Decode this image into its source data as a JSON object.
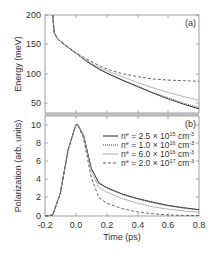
{
  "chart_data": [
    {
      "type": "line",
      "panel_label": "(a)",
      "title": "",
      "xlabel": "",
      "ylabel": "Energy (meV)",
      "xlim": [
        -0.2,
        0.8
      ],
      "ylim": [
        33,
        200
      ],
      "yticks": [
        50,
        100,
        150,
        200
      ],
      "grid": false,
      "x": [
        -0.15,
        -0.14,
        -0.12,
        -0.1,
        -0.05,
        0.0,
        0.05,
        0.1,
        0.15,
        0.2,
        0.3,
        0.4,
        0.5,
        0.6,
        0.7,
        0.8
      ],
      "series": [
        {
          "name": "n^e = 2.5 × 10^15 cm^-3",
          "style": "solid",
          "color": "#222222",
          "values": [
            200,
            170,
            160,
            155,
            145,
            135,
            125,
            116,
            108,
            101,
            89,
            78,
            67,
            57,
            48,
            40
          ]
        },
        {
          "name": "n^e = 1.0 × 10^16 cm^-3",
          "style": "dotted",
          "color": "#444444",
          "values": [
            200,
            170,
            160,
            155,
            145,
            135,
            125,
            116,
            108,
            102,
            90,
            79,
            68,
            59,
            50,
            42
          ]
        },
        {
          "name": "n^e = 6.0 × 10^16 cm^-3",
          "style": "solid-light",
          "color": "#aaaaaa",
          "values": [
            200,
            170,
            160,
            155,
            145,
            135,
            126,
            118,
            111,
            105,
            95,
            85,
            76,
            68,
            61,
            55
          ]
        },
        {
          "name": "n^e = 2.0 × 10^17 cm^-3",
          "style": "dashed",
          "color": "#555555",
          "values": [
            200,
            170,
            160,
            155,
            145,
            136,
            128,
            121,
            114,
            108,
            100,
            95,
            91,
            89,
            88,
            87
          ]
        }
      ]
    },
    {
      "type": "line",
      "panel_label": "(b)",
      "title": "",
      "xlabel": "Time (ps)",
      "ylabel": "Polarization (arb. units)",
      "xlim": [
        -0.2,
        0.8
      ],
      "ylim": [
        0,
        10.5
      ],
      "xticks": [
        -0.2,
        0.0,
        0.2,
        0.4,
        0.6,
        0.8
      ],
      "yticks": [
        0,
        2,
        4,
        6,
        8,
        10
      ],
      "grid": false,
      "legend_position": "upper right",
      "x": [
        -0.2,
        -0.15,
        -0.1,
        -0.05,
        0.0,
        0.01,
        0.05,
        0.1,
        0.15,
        0.2,
        0.3,
        0.4,
        0.5,
        0.6,
        0.7,
        0.8
      ],
      "series": [
        {
          "name": "n^e = 2.5 × 10^15 cm^-3",
          "style": "solid",
          "color": "#222222",
          "values": [
            0,
            0.1,
            2.5,
            7.2,
            9.9,
            10.0,
            8.8,
            5.2,
            3.6,
            3.1,
            2.4,
            1.9,
            1.5,
            1.15,
            0.9,
            0.7
          ]
        },
        {
          "name": "n^e = 1.0 × 10^16 cm^-3",
          "style": "dotted",
          "color": "#444444",
          "values": [
            0,
            0.1,
            2.5,
            7.2,
            9.9,
            10.0,
            8.8,
            5.2,
            3.55,
            3.05,
            2.35,
            1.85,
            1.45,
            1.1,
            0.85,
            0.65
          ]
        },
        {
          "name": "n^e = 6.0 × 10^16 cm^-3",
          "style": "solid-light",
          "color": "#aaaaaa",
          "values": [
            0,
            0.1,
            2.5,
            7.2,
            9.9,
            10.0,
            8.7,
            4.9,
            3.1,
            2.6,
            1.9,
            1.4,
            1.0,
            0.75,
            0.55,
            0.4
          ]
        },
        {
          "name": "n^e = 2.0 × 10^17 cm^-3",
          "style": "dashed",
          "color": "#555555",
          "values": [
            0,
            0.1,
            2.5,
            7.2,
            9.9,
            10.0,
            8.5,
            4.2,
            2.0,
            1.4,
            0.8,
            0.45,
            0.25,
            0.12,
            0.07,
            0.05
          ]
        }
      ]
    }
  ],
  "legend": [
    {
      "prefix": "n",
      "sup1": "e",
      "mid": " = 2.5 × 10",
      "sup2": "15",
      "unit": " cm",
      "sup3": "-3"
    },
    {
      "prefix": "n",
      "sup1": "e",
      "mid": " = 1.0 × 10",
      "sup2": "16",
      "unit": " cm",
      "sup3": "-3"
    },
    {
      "prefix": "n",
      "sup1": "e",
      "mid": " = 6.0 × 10",
      "sup2": "16",
      "unit": " cm",
      "sup3": "-3"
    },
    {
      "prefix": "n",
      "sup1": "e",
      "mid": " = 2.0 × 10",
      "sup2": "17",
      "unit": " cm",
      "sup3": "-3"
    }
  ],
  "labels": {
    "panel_a": "(a)",
    "panel_b": "(b)",
    "ylabel_a": "Energy (meV)",
    "ylabel_b": "Polarization (arb. units)",
    "xlabel": "Time (ps)",
    "yticks_a": [
      "200",
      "150",
      "100",
      "50"
    ],
    "yticks_b": [
      "10",
      "8",
      "6",
      "4",
      "2",
      "0"
    ],
    "xticks": [
      "-0.2",
      "0.0",
      "0.2",
      "0.4",
      "0.6",
      "0.8"
    ]
  }
}
